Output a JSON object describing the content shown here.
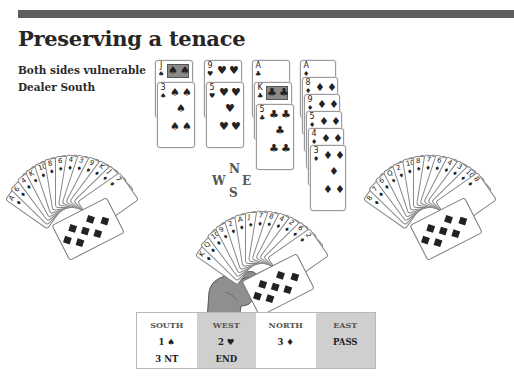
{
  "header": {
    "title": "Preserving a tenace",
    "vulnerability": "Both sides vulnerable",
    "dealer": "Dealer South"
  },
  "colors": {
    "topbar": "#5e5e5e",
    "bid_shade": "#cfcfcf",
    "hand": "#8f8f8f"
  },
  "compass": {
    "n": "N",
    "s": "S",
    "w": "W",
    "e": "E"
  },
  "north": {
    "columns": [
      {
        "suit": "spades",
        "symbol": "♠",
        "cards": [
          "J",
          "3"
        ]
      },
      {
        "suit": "hearts",
        "symbol": "♥",
        "cards": [
          "9",
          "5"
        ]
      },
      {
        "suit": "clubs",
        "symbol": "♣",
        "cards": [
          "A",
          "K",
          "5"
        ]
      },
      {
        "suit": "diamonds",
        "symbol": "♦",
        "cards": [
          "A",
          "8",
          "9",
          "5",
          "4",
          "3"
        ]
      }
    ]
  },
  "west": {
    "cards": [
      "A",
      "6",
      "4",
      "K",
      "10",
      "8",
      "6",
      "4",
      "3",
      "9",
      "K",
      "J",
      "7"
    ],
    "front_card": {
      "rank": "7",
      "symbol": "♦"
    }
  },
  "east": {
    "cards": [
      "8",
      "7",
      "6",
      "Q",
      "2",
      "10",
      "8",
      "7",
      "6",
      "4",
      "3",
      "10",
      "8"
    ],
    "front_card": {
      "rank": "8",
      "symbol": "♦"
    }
  },
  "south": {
    "cards": [
      "K",
      "Q",
      "10",
      "9",
      "2",
      "A",
      "J",
      "7",
      "8",
      "4",
      "2",
      "6",
      "2"
    ],
    "front_card": {
      "rank": "2",
      "symbol": "♦"
    }
  },
  "bidding": {
    "columns": [
      {
        "seat": "SOUTH",
        "bids": [
          "1 ♠",
          "3 NT"
        ],
        "shaded": false
      },
      {
        "seat": "WEST",
        "bids": [
          "2 ♥",
          "END"
        ],
        "shaded": true
      },
      {
        "seat": "NORTH",
        "bids": [
          "3 ♦",
          ""
        ],
        "shaded": false
      },
      {
        "seat": "EAST",
        "bids": [
          "PASS",
          ""
        ],
        "shaded": true
      }
    ]
  }
}
